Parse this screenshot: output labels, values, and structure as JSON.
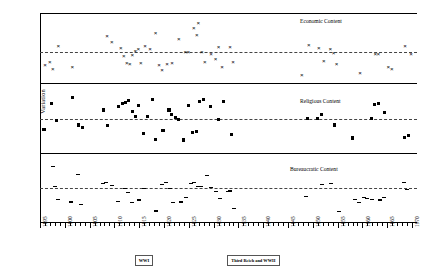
{
  "chart_data": {
    "type": "scatter",
    "title": "",
    "xlabel": "",
    "ylabel": "Variation",
    "xlim": [
      1895,
      1971
    ],
    "grid": false,
    "legend_position": "inside-panel-right",
    "tick_labels": [
      "1895",
      "1900",
      "1905",
      "1910",
      "1915",
      "1920",
      "1925",
      "1930",
      "1935",
      "1940",
      "1945",
      "1950",
      "1955",
      "1960",
      "1965",
      "1970"
    ],
    "tick_step": 5,
    "minor_tick_step": 1,
    "annotations": [
      {
        "label": "WWI",
        "x": 1916
      },
      {
        "label": "Third Reich and WWII",
        "x": 1938
      }
    ],
    "panels": [
      {
        "name": "economic",
        "label": "Economic Content",
        "marker": "x",
        "mean_line": 0.0,
        "ylim": [
          -1.0,
          1.25
        ],
        "points": [
          {
            "x": 1896,
            "y": -0.42
          },
          {
            "x": 1897,
            "y": -0.3
          },
          {
            "x": 1897.6,
            "y": -0.52
          },
          {
            "x": 1898.7,
            "y": 0.22
          },
          {
            "x": 1901.5,
            "y": -0.48
          },
          {
            "x": 1908.5,
            "y": 0.52
          },
          {
            "x": 1909.5,
            "y": 0.34
          },
          {
            "x": 1911.3,
            "y": 0.13
          },
          {
            "x": 1911.9,
            "y": -0.1
          },
          {
            "x": 1912.5,
            "y": -0.35
          },
          {
            "x": 1913.1,
            "y": -0.36
          },
          {
            "x": 1913.6,
            "y": -0.08
          },
          {
            "x": 1914.2,
            "y": 0.06
          },
          {
            "x": 1914.8,
            "y": 0.12
          },
          {
            "x": 1915.3,
            "y": -0.34
          },
          {
            "x": 1916.2,
            "y": 0.2
          },
          {
            "x": 1917.2,
            "y": 0.1
          },
          {
            "x": 1918.3,
            "y": 0.63
          },
          {
            "x": 1919.0,
            "y": -0.42
          },
          {
            "x": 1919.6,
            "y": -0.58
          },
          {
            "x": 1920.6,
            "y": -0.38
          },
          {
            "x": 1921.6,
            "y": -0.34
          },
          {
            "x": 1923.0,
            "y": 0.44
          },
          {
            "x": 1924.3,
            "y": 0.02
          },
          {
            "x": 1924.9,
            "y": 0.0
          },
          {
            "x": 1926.0,
            "y": 0.78
          },
          {
            "x": 1926.6,
            "y": 0.56
          },
          {
            "x": 1926.9,
            "y": 0.96
          },
          {
            "x": 1927.6,
            "y": 0.02
          },
          {
            "x": 1928.2,
            "y": -0.3
          },
          {
            "x": 1929.5,
            "y": -0.06
          },
          {
            "x": 1930.4,
            "y": -0.22
          },
          {
            "x": 1931.0,
            "y": 0.16
          },
          {
            "x": 1931.7,
            "y": -0.46
          },
          {
            "x": 1933.3,
            "y": 0.16
          },
          {
            "x": 1933.9,
            "y": -0.32
          },
          {
            "x": 1947.8,
            "y": -0.74
          },
          {
            "x": 1949.2,
            "y": 0.24
          },
          {
            "x": 1951.2,
            "y": 0.14
          },
          {
            "x": 1952.2,
            "y": -0.28
          },
          {
            "x": 1953.5,
            "y": 0.1
          },
          {
            "x": 1954.2,
            "y": -0.02
          },
          {
            "x": 1954.8,
            "y": -0.36
          },
          {
            "x": 1959.5,
            "y": -0.66
          },
          {
            "x": 1962.6,
            "y": -0.04
          },
          {
            "x": 1963.2,
            "y": -0.04
          },
          {
            "x": 1965.2,
            "y": -0.48
          },
          {
            "x": 1965.9,
            "y": -0.52
          },
          {
            "x": 1968.6,
            "y": 0.2
          },
          {
            "x": 1969.8,
            "y": -0.04
          }
        ]
      },
      {
        "name": "religious",
        "label": "Religious Content",
        "marker": "square",
        "mean_line": 0.0,
        "ylim": [
          -1.0,
          1.05
        ],
        "points": [
          {
            "x": 1895.8,
            "y": -0.3
          },
          {
            "x": 1897.3,
            "y": 0.46
          },
          {
            "x": 1898.3,
            "y": -0.04
          },
          {
            "x": 1901.5,
            "y": 0.62
          },
          {
            "x": 1902.8,
            "y": -0.18
          },
          {
            "x": 1903.6,
            "y": -0.24
          },
          {
            "x": 1907.8,
            "y": 0.26
          },
          {
            "x": 1908.6,
            "y": -0.2
          },
          {
            "x": 1910.9,
            "y": 0.36
          },
          {
            "x": 1911.6,
            "y": 0.46
          },
          {
            "x": 1912.3,
            "y": 0.48
          },
          {
            "x": 1912.9,
            "y": 0.54
          },
          {
            "x": 1913.6,
            "y": 0.22
          },
          {
            "x": 1914.3,
            "y": 0.06
          },
          {
            "x": 1914.9,
            "y": 0.38
          },
          {
            "x": 1915.8,
            "y": -0.44
          },
          {
            "x": 1916.7,
            "y": 0.08
          },
          {
            "x": 1917.6,
            "y": 0.56
          },
          {
            "x": 1918.3,
            "y": -0.6
          },
          {
            "x": 1919.8,
            "y": -0.34
          },
          {
            "x": 1921.0,
            "y": 0.26
          },
          {
            "x": 1921.6,
            "y": 0.14
          },
          {
            "x": 1922.3,
            "y": 0.04
          },
          {
            "x": 1922.9,
            "y": -0.02
          },
          {
            "x": 1923.9,
            "y": -0.62
          },
          {
            "x": 1925.0,
            "y": 0.4
          },
          {
            "x": 1925.8,
            "y": -0.4
          },
          {
            "x": 1926.5,
            "y": -0.38
          },
          {
            "x": 1927.2,
            "y": 0.5
          },
          {
            "x": 1927.9,
            "y": 0.56
          },
          {
            "x": 1929.4,
            "y": 0.36
          },
          {
            "x": 1930.9,
            "y": -0.02
          },
          {
            "x": 1932.0,
            "y": 0.5
          },
          {
            "x": 1933.6,
            "y": -0.46
          },
          {
            "x": 1948.9,
            "y": 0.0
          },
          {
            "x": 1951.0,
            "y": 0.02
          },
          {
            "x": 1951.7,
            "y": 0.12
          },
          {
            "x": 1954.4,
            "y": -0.18
          },
          {
            "x": 1958.0,
            "y": -0.56
          },
          {
            "x": 1961.8,
            "y": 0.02
          },
          {
            "x": 1962.5,
            "y": 0.42
          },
          {
            "x": 1963.2,
            "y": 0.46
          },
          {
            "x": 1964.4,
            "y": 0.18
          },
          {
            "x": 1968.5,
            "y": -0.54
          },
          {
            "x": 1969.3,
            "y": -0.48
          }
        ]
      },
      {
        "name": "bureaucratic",
        "label": "Bureaucratic Content",
        "marker": "dash",
        "mean_line": 0.0,
        "ylim": [
          -1.0,
          1.0
        ],
        "points": [
          {
            "x": 1897.7,
            "y": 0.62
          },
          {
            "x": 1898.1,
            "y": 0.02
          },
          {
            "x": 1898.6,
            "y": -0.34
          },
          {
            "x": 1901.2,
            "y": -0.42
          },
          {
            "x": 1902.6,
            "y": 0.38
          },
          {
            "x": 1903.3,
            "y": -0.48
          },
          {
            "x": 1907.6,
            "y": 0.12
          },
          {
            "x": 1908.4,
            "y": 0.14
          },
          {
            "x": 1909.6,
            "y": 0.06
          },
          {
            "x": 1910.7,
            "y": -0.4
          },
          {
            "x": 1912.1,
            "y": -0.02
          },
          {
            "x": 1912.8,
            "y": -0.14
          },
          {
            "x": 1913.5,
            "y": -0.44
          },
          {
            "x": 1915.0,
            "y": -0.36
          },
          {
            "x": 1916.0,
            "y": -0.04
          },
          {
            "x": 1918.4,
            "y": -0.68
          },
          {
            "x": 1919.6,
            "y": 0.08
          },
          {
            "x": 1920.4,
            "y": 0.14
          },
          {
            "x": 1921.2,
            "y": -0.04
          },
          {
            "x": 1921.9,
            "y": -0.44
          },
          {
            "x": 1923.4,
            "y": -0.42
          },
          {
            "x": 1924.4,
            "y": -0.28
          },
          {
            "x": 1925.4,
            "y": 0.12
          },
          {
            "x": 1926.1,
            "y": 0.14
          },
          {
            "x": 1926.8,
            "y": 0.04
          },
          {
            "x": 1927.5,
            "y": 0.02
          },
          {
            "x": 1928.6,
            "y": 0.36
          },
          {
            "x": 1929.4,
            "y": 0.0
          },
          {
            "x": 1930.4,
            "y": -0.12
          },
          {
            "x": 1931.2,
            "y": -0.32
          },
          {
            "x": 1932.9,
            "y": -0.12
          },
          {
            "x": 1933.4,
            "y": -0.1
          },
          {
            "x": 1934.2,
            "y": -0.62
          },
          {
            "x": 1948.6,
            "y": -0.26
          },
          {
            "x": 1951.8,
            "y": 0.08
          },
          {
            "x": 1953.7,
            "y": 0.12
          },
          {
            "x": 1955.2,
            "y": -0.7
          },
          {
            "x": 1958.5,
            "y": -0.34
          },
          {
            "x": 1959.3,
            "y": -0.44
          },
          {
            "x": 1960.3,
            "y": -0.3
          },
          {
            "x": 1960.9,
            "y": -0.32
          },
          {
            "x": 1961.9,
            "y": -0.34
          },
          {
            "x": 1963.6,
            "y": -0.36
          },
          {
            "x": 1964.4,
            "y": -0.28
          },
          {
            "x": 1968.3,
            "y": 0.14
          },
          {
            "x": 1969.0,
            "y": -0.06
          }
        ]
      }
    ]
  }
}
